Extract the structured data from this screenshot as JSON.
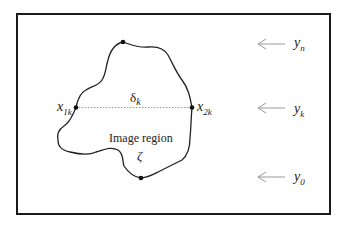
{
  "diagram": {
    "region_label": "Image region",
    "region_symbol": "ζ",
    "width_label": {
      "base": "δ",
      "sub": "k"
    },
    "left_point": {
      "base": "x",
      "sub": "1k"
    },
    "right_point": {
      "base": "x",
      "sub": "2k"
    },
    "scan_lines": [
      {
        "base": "y",
        "sub": "n"
      },
      {
        "base": "y",
        "sub": "k"
      },
      {
        "base": "y",
        "sub": "0"
      }
    ],
    "colors": {
      "frame": "#1a1a1a",
      "contour": "#222222",
      "arrow": "#9a9a9a",
      "dotted": "#9a9a9a"
    }
  }
}
